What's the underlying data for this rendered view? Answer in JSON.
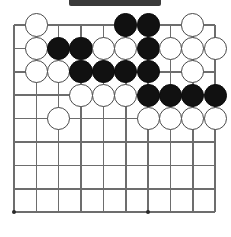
{
  "figure": {
    "artifact_bar_label": "scan-artifact-bar"
  },
  "board": {
    "columns": 10,
    "rows": 9,
    "origin_x": 14,
    "origin_y": 25,
    "spacing_x": 22.35,
    "spacing_y": 23.4,
    "line_color": "#6d6d6d",
    "background_color": "#ffffff",
    "black_color": "#111111",
    "white_color": "#ffffff",
    "stone_radius": 11.6,
    "star_points": [
      {
        "col": 0,
        "row": 8
      },
      {
        "col": 6,
        "row": 8
      }
    ],
    "stones": [
      {
        "col": 1,
        "row": 0,
        "color": "white"
      },
      {
        "col": 5,
        "row": 0,
        "color": "black"
      },
      {
        "col": 6,
        "row": 0,
        "color": "black"
      },
      {
        "col": 8,
        "row": 0,
        "color": "white"
      },
      {
        "col": 1,
        "row": 1,
        "color": "white"
      },
      {
        "col": 2,
        "row": 1,
        "color": "black"
      },
      {
        "col": 3,
        "row": 1,
        "color": "black"
      },
      {
        "col": 4,
        "row": 1,
        "color": "white"
      },
      {
        "col": 5,
        "row": 1,
        "color": "white"
      },
      {
        "col": 6,
        "row": 1,
        "color": "black"
      },
      {
        "col": 7,
        "row": 1,
        "color": "white"
      },
      {
        "col": 8,
        "row": 1,
        "color": "white"
      },
      {
        "col": 9,
        "row": 1,
        "color": "white"
      },
      {
        "col": 1,
        "row": 2,
        "color": "white"
      },
      {
        "col": 2,
        "row": 2,
        "color": "white"
      },
      {
        "col": 3,
        "row": 2,
        "color": "black"
      },
      {
        "col": 4,
        "row": 2,
        "color": "black"
      },
      {
        "col": 5,
        "row": 2,
        "color": "black"
      },
      {
        "col": 6,
        "row": 2,
        "color": "black"
      },
      {
        "col": 8,
        "row": 2,
        "color": "white"
      },
      {
        "col": 3,
        "row": 3,
        "color": "white"
      },
      {
        "col": 4,
        "row": 3,
        "color": "white"
      },
      {
        "col": 5,
        "row": 3,
        "color": "white"
      },
      {
        "col": 6,
        "row": 3,
        "color": "black"
      },
      {
        "col": 7,
        "row": 3,
        "color": "black"
      },
      {
        "col": 8,
        "row": 3,
        "color": "black"
      },
      {
        "col": 9,
        "row": 3,
        "color": "black"
      },
      {
        "col": 2,
        "row": 4,
        "color": "white"
      },
      {
        "col": 6,
        "row": 4,
        "color": "white"
      },
      {
        "col": 7,
        "row": 4,
        "color": "white"
      },
      {
        "col": 8,
        "row": 4,
        "color": "white"
      },
      {
        "col": 9,
        "row": 4,
        "color": "white"
      }
    ]
  }
}
